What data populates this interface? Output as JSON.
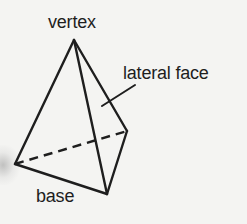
{
  "diagram": {
    "labels": {
      "vertex": "vertex",
      "lateral_face": "lateral face",
      "base": "base"
    },
    "colors": {
      "stroke": "#1e1e1e",
      "background": "#f4f4f2"
    },
    "points": {
      "apex": [
        74,
        40
      ],
      "base_left": [
        15,
        164
      ],
      "base_back_right": [
        127,
        131
      ],
      "base_front": [
        107,
        194
      ]
    },
    "edges": [
      {
        "from": "apex",
        "to": "base_left",
        "style": "solid"
      },
      {
        "from": "apex",
        "to": "base_front",
        "style": "solid"
      },
      {
        "from": "apex",
        "to": "base_back_right",
        "style": "solid"
      },
      {
        "from": "base_left",
        "to": "base_front",
        "style": "solid"
      },
      {
        "from": "base_front",
        "to": "base_back_right",
        "style": "solid"
      },
      {
        "from": "base_left",
        "to": "base_back_right",
        "style": "dashed"
      }
    ],
    "leader_line": {
      "from": [
        102,
        106
      ],
      "to": [
        135,
        85
      ],
      "points_to": "lateral_face"
    }
  }
}
